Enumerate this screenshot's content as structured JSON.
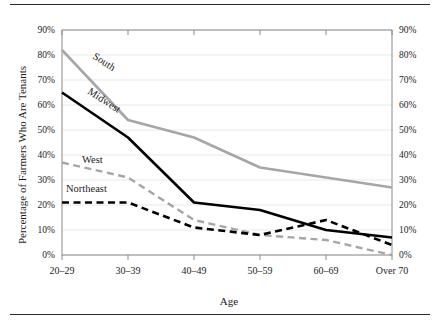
{
  "figure": {
    "has_top_rule": true,
    "has_bottom_rule": true
  },
  "chart_data": {
    "type": "line",
    "title": "",
    "xlabel": "Age",
    "ylabel": "Percentage of Farmers Who Are Tenants",
    "ylabel_right": "",
    "categories": [
      "20–29",
      "30–39",
      "40–49",
      "50–59",
      "60–69",
      "Over 70"
    ],
    "ylim": [
      0,
      90
    ],
    "ytick_values": [
      0,
      10,
      20,
      30,
      40,
      50,
      60,
      70,
      80,
      90
    ],
    "ytick_labels": [
      "0%",
      "10%",
      "20%",
      "30%",
      "40%",
      "50%",
      "60%",
      "70%",
      "80%",
      "90%"
    ],
    "ytick_labels_right": [
      "0%",
      "10%",
      "20%",
      "30%",
      "40%",
      "50%",
      "60%",
      "70%",
      "80%",
      "90%"
    ],
    "grid": true,
    "grid_axis": "y",
    "legend": "inline-labels",
    "legend_position": "none",
    "series": [
      {
        "name": "South",
        "values": [
          82,
          54,
          47,
          35,
          31,
          27
        ],
        "color": "#a6a6a6",
        "style": "solid",
        "width": 2.6,
        "label_x": 92,
        "label_y": 58,
        "label_rotate": 33
      },
      {
        "name": "Midwest",
        "values": [
          65,
          47,
          21,
          18,
          10,
          7
        ],
        "color": "#000000",
        "style": "solid",
        "width": 2.6,
        "label_x": 87,
        "label_y": 93,
        "label_rotate": 33
      },
      {
        "name": "West",
        "values": [
          37,
          31,
          14,
          8,
          6,
          0
        ],
        "color": "#a6a6a6",
        "style": "dashed",
        "width": 2.4,
        "label_x": 82,
        "label_y": 163,
        "label_rotate": 0
      },
      {
        "name": "Northeast",
        "values": [
          21,
          21,
          11,
          8,
          14,
          4
        ],
        "color": "#000000",
        "style": "dashed",
        "width": 2.6,
        "label_x": 66,
        "label_y": 192,
        "label_rotate": 0
      }
    ]
  },
  "colors": {
    "gray_series": "#a6a6a6",
    "black_series": "#000000",
    "gridline": "#e9e9e9",
    "frame": "#8a8a8a",
    "text": "#1c1c1c",
    "rule": "#2b2b2b"
  }
}
